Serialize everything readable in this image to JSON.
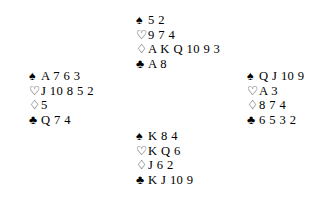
{
  "deal": {
    "background_color": "#ffffff",
    "text_color": "#000000",
    "suit_symbols": {
      "spades": "♠",
      "hearts": "♡",
      "diamonds": "♢",
      "clubs": "♣"
    },
    "suit_order": [
      "spades",
      "hearts",
      "diamonds",
      "clubs"
    ],
    "hands": {
      "north": {
        "spades": "5 2",
        "hearts": "9 7 4",
        "diamonds": "A K Q 10 9 3",
        "clubs": "A 8"
      },
      "west": {
        "spades": "A 7 6 3",
        "hearts": "J 10 8 5 2",
        "diamonds": "5",
        "clubs": "Q 7 4"
      },
      "east": {
        "spades": "Q J 10 9",
        "hearts": "A 3",
        "diamonds": "8 7 4",
        "clubs": "6 5 3 2"
      },
      "south": {
        "spades": "K 8 4",
        "hearts": "K Q 6",
        "diamonds": "J 6 2",
        "clubs": "K J 10 9"
      }
    }
  }
}
